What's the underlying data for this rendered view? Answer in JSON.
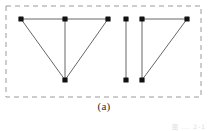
{
  "figure": {
    "caption": "(a)",
    "corner_note": "图 ... 2-1",
    "colors": {
      "node_fill": "#111111",
      "edge_stroke": "#555555",
      "border_stroke": "#9a9a9a",
      "caption_text": "#2b2b2b",
      "background": "#ffffff"
    },
    "border": {
      "style": "dashed",
      "x": 6,
      "y": 6,
      "width": 195,
      "height": 91,
      "dash": "5 4",
      "stroke_width": 1
    },
    "node_radius": 2.6,
    "components": [
      {
        "name": "left-component",
        "nodes": [
          {
            "id": "L1",
            "label": "",
            "x": 21,
            "y": 19
          },
          {
            "id": "L2",
            "label": "",
            "x": 65,
            "y": 19
          },
          {
            "id": "L3",
            "label": "",
            "x": 108,
            "y": 19
          },
          {
            "id": "L4",
            "label": "",
            "x": 65,
            "y": 80
          }
        ],
        "edges": [
          {
            "from": "L1",
            "to": "L2"
          },
          {
            "from": "L2",
            "to": "L3"
          },
          {
            "from": "L1",
            "to": "L4"
          },
          {
            "from": "L2",
            "to": "L4"
          },
          {
            "from": "L3",
            "to": "L4"
          }
        ]
      },
      {
        "name": "middle-component",
        "nodes": [
          {
            "id": "M1",
            "label": "",
            "x": 126,
            "y": 19
          },
          {
            "id": "M2",
            "label": "",
            "x": 126,
            "y": 80
          }
        ],
        "edges": [
          {
            "from": "M1",
            "to": "M2"
          }
        ]
      },
      {
        "name": "right-component",
        "nodes": [
          {
            "id": "R1",
            "label": "",
            "x": 142,
            "y": 19
          },
          {
            "id": "R2",
            "label": "",
            "x": 187,
            "y": 19
          },
          {
            "id": "R3",
            "label": "",
            "x": 142,
            "y": 80
          }
        ],
        "edges": [
          {
            "from": "R1",
            "to": "R2"
          },
          {
            "from": "R1",
            "to": "R3"
          },
          {
            "from": "R2",
            "to": "R3"
          }
        ]
      }
    ]
  }
}
